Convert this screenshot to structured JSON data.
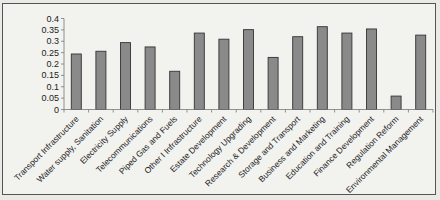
{
  "chart_data": {
    "type": "bar",
    "title": "",
    "xlabel": "",
    "ylabel": "",
    "ylim": [
      0,
      0.4
    ],
    "yticks": [
      0,
      0.05,
      0.1,
      0.15,
      0.2,
      0.25,
      0.3,
      0.35,
      0.4
    ],
    "ytick_labels": [
      "0",
      "0.05",
      "0.1",
      "0.15",
      "0.2",
      "0.25",
      "0.3",
      "0.35",
      "0.4"
    ],
    "grid": false,
    "legend": null,
    "categories": [
      "Transport Infrastructure",
      "Water supply, Sanitation",
      "Electricity Supply",
      "Telecommunications",
      "Piped Gas and Fuels",
      "Other I Infrastructure",
      "Estate Development",
      "Technology Upgrading",
      "Research & Development",
      "Storage and Transport",
      "Business and Marketing",
      "Education and Training",
      "Finance Development",
      "Regulation Reform",
      "Environmental Management"
    ],
    "values": [
      0.244,
      0.256,
      0.294,
      0.275,
      0.168,
      0.336,
      0.309,
      0.351,
      0.229,
      0.32,
      0.364,
      0.336,
      0.354,
      0.059,
      0.327
    ],
    "colors": {
      "bar_fill": "#8a8a8a",
      "bar_stroke": "#333333",
      "background": "#f2f2ef"
    }
  }
}
